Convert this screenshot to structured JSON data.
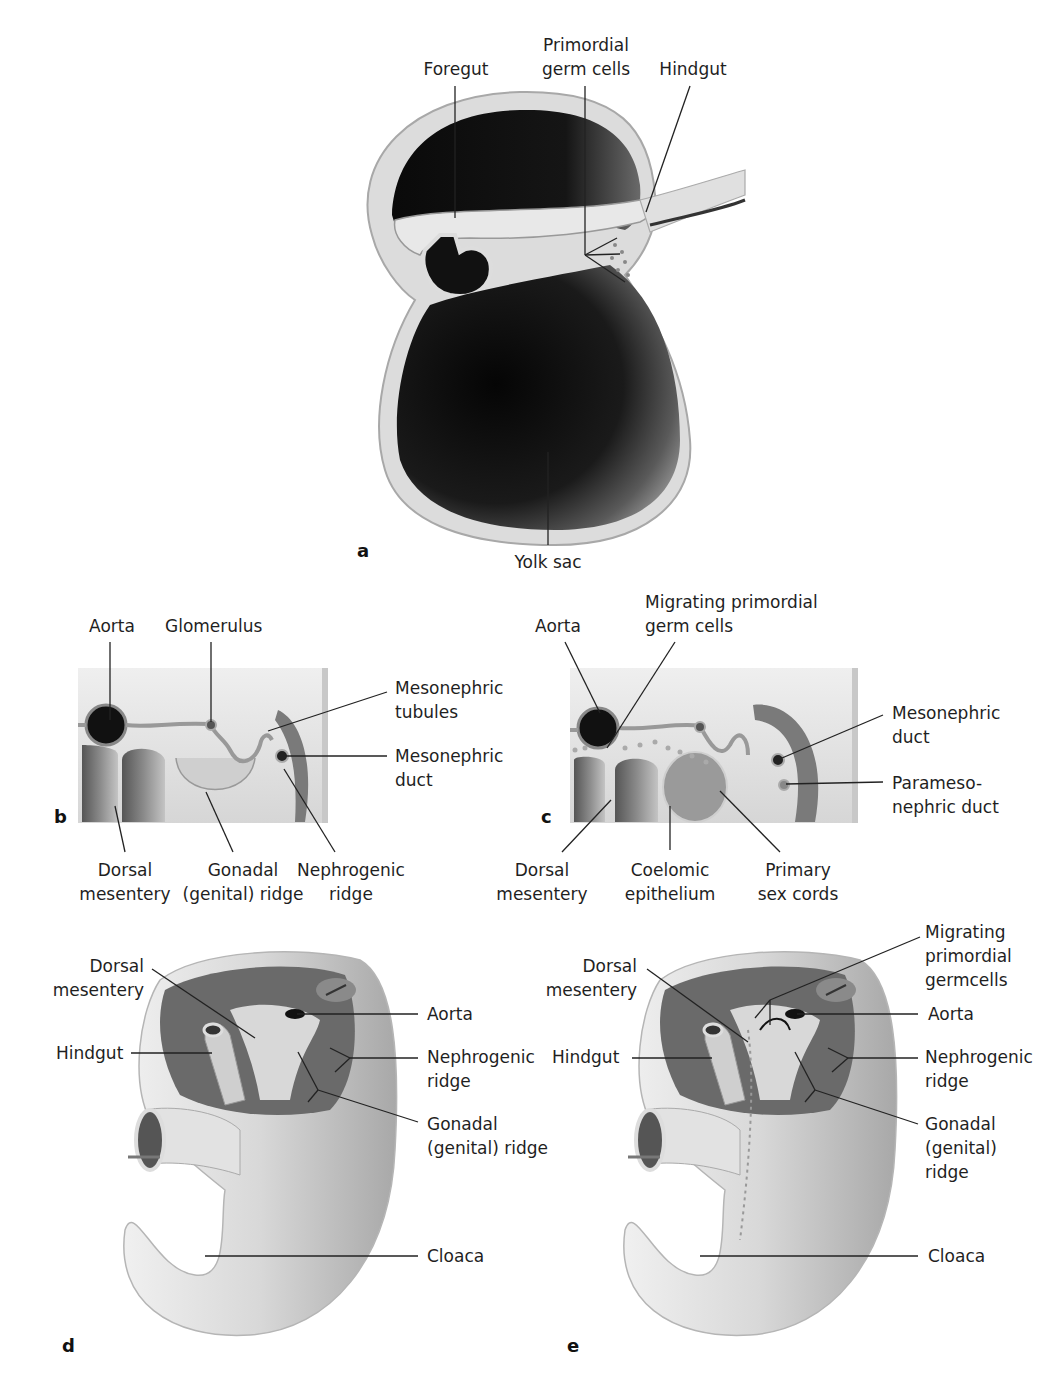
{
  "figure": {
    "panels": {
      "a": {
        "letter": "a",
        "labels": {
          "foregut": "Foregut",
          "primordial_germ_cells": "Primordial\ngerm cells",
          "hindgut": "Hindgut",
          "yolk_sac": "Yolk sac"
        }
      },
      "b": {
        "letter": "b",
        "labels": {
          "aorta": "Aorta",
          "glomerulus": "Glomerulus",
          "mesonephric_tubules": "Mesonephric\ntubules",
          "mesonephric_duct": "Mesonephric\nduct",
          "dorsal_mesentery": "Dorsal\nmesentery",
          "gonadal_ridge": "Gonadal\n(genital) ridge",
          "nephrogenic_ridge": "Nephrogenic\nridge"
        }
      },
      "c": {
        "letter": "c",
        "labels": {
          "aorta": "Aorta",
          "migrating_pgc": "Migrating primordial\ngerm cells",
          "mesonephric_duct": "Mesonephric\nduct",
          "paramesonephric_duct": "Parameso-\nnephric duct",
          "dorsal_mesentery": "Dorsal\nmesentery",
          "coelomic_epithelium": "Coelomic\nepithelium",
          "primary_sex_cords": "Primary\nsex cords"
        }
      },
      "d": {
        "letter": "d",
        "labels": {
          "dorsal_mesentery": "Dorsal\nmesentery",
          "aorta": "Aorta",
          "hindgut": "Hindgut",
          "nephrogenic_ridge": "Nephrogenic\nridge",
          "gonadal_ridge": "Gonadal\n(genital) ridge",
          "cloaca": "Cloaca"
        }
      },
      "e": {
        "letter": "e",
        "labels": {
          "migrating_pgc": "Migrating\nprimordial\ngermcells",
          "dorsal_mesentery": "Dorsal\nmesentery",
          "aorta": "Aorta",
          "hindgut": "Hindgut",
          "nephrogenic_ridge": "Nephrogenic\nridge",
          "gonadal_ridge": "Gonadal\n(genital)\nridge",
          "cloaca": "Cloaca"
        }
      }
    },
    "colors": {
      "cavity_dark": "#0d0d0d",
      "tissue_light": "#e6e6e6",
      "tissue_mid": "#bdbdbd",
      "tissue_shadow": "#7a7a7a",
      "leader_line": "#222222"
    }
  }
}
